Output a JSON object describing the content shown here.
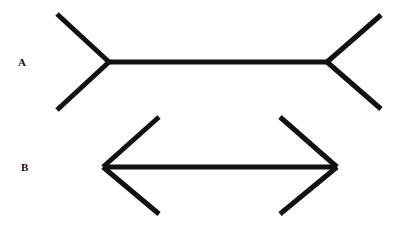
{
  "figure": {
    "stroke_color": "#111111",
    "background": "#ffffff",
    "figures": [
      {
        "label": "A",
        "variant": "fins-outward",
        "shaft": {
          "x1": 109,
          "y1": 62,
          "x2": 327,
          "y2": 62
        },
        "fins": [
          {
            "x1": 109,
            "y1": 62,
            "x2": 57,
            "y2": 14
          },
          {
            "x1": 109,
            "y1": 62,
            "x2": 57,
            "y2": 110
          },
          {
            "x1": 327,
            "y1": 62,
            "x2": 381,
            "y2": 15
          },
          {
            "x1": 327,
            "y1": 62,
            "x2": 381,
            "y2": 109
          }
        ]
      },
      {
        "label": "B",
        "variant": "fins-inward",
        "shaft": {
          "x1": 103,
          "y1": 167,
          "x2": 337,
          "y2": 167
        },
        "fins": [
          {
            "x1": 103,
            "y1": 167,
            "x2": 159,
            "y2": 117
          },
          {
            "x1": 103,
            "y1": 167,
            "x2": 159,
            "y2": 214
          },
          {
            "x1": 337,
            "y1": 167,
            "x2": 280,
            "y2": 117
          },
          {
            "x1": 337,
            "y1": 167,
            "x2": 280,
            "y2": 214
          }
        ]
      }
    ]
  }
}
